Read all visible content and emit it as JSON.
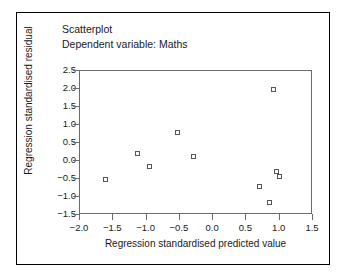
{
  "figure": {
    "background": "#ffffff",
    "frame_color": "#000000",
    "axis_color": "#6b6b6b",
    "marker_color": "#555555"
  },
  "titles": {
    "line1": "Scatterplot",
    "line2": "Dependent variable: Maths"
  },
  "chart_data": {
    "type": "scatter",
    "title": "Scatterplot",
    "subtitle": "Dependent variable: Maths",
    "xlabel": "Regression standardised predicted value",
    "ylabel": "Regression standardised residual",
    "xlim": [
      -2.0,
      1.5
    ],
    "ylim": [
      -1.5,
      2.5
    ],
    "xticks": [
      -2.0,
      -1.5,
      -1.0,
      -0.5,
      0.0,
      0.5,
      1.0,
      1.5
    ],
    "xticklabels": [
      "−2.0",
      "−1.5",
      "−1.0",
      "−0.5",
      "0.0",
      "0.5",
      "1.0",
      "1.5"
    ],
    "yticks": [
      -1.5,
      -1.0,
      -0.5,
      0.0,
      0.5,
      1.0,
      1.5,
      2.0,
      2.5
    ],
    "yticklabels": [
      "−1.5",
      "−1.0",
      "−0.5",
      "0.0",
      "0.5",
      "1.0",
      "1.5",
      "2.0",
      "2.5"
    ],
    "grid": false,
    "legend": null,
    "marker": "open-square",
    "x": [
      -1.62,
      -1.13,
      -0.96,
      -0.53,
      -0.3,
      0.7,
      0.85,
      0.91,
      0.95,
      1.0
    ],
    "y": [
      -0.5,
      0.21,
      -0.15,
      0.8,
      0.12,
      -0.7,
      -1.15,
      2.0,
      -0.29,
      -0.43
    ],
    "points": [
      {
        "x": -1.62,
        "y": -0.5
      },
      {
        "x": -1.13,
        "y": 0.21
      },
      {
        "x": -0.96,
        "y": -0.15
      },
      {
        "x": -0.53,
        "y": 0.8
      },
      {
        "x": -0.3,
        "y": 0.12
      },
      {
        "x": 0.7,
        "y": -0.7
      },
      {
        "x": 0.85,
        "y": -1.15
      },
      {
        "x": 0.91,
        "y": 2.0
      },
      {
        "x": 0.95,
        "y": -0.29
      },
      {
        "x": 1.0,
        "y": -0.43
      }
    ]
  }
}
